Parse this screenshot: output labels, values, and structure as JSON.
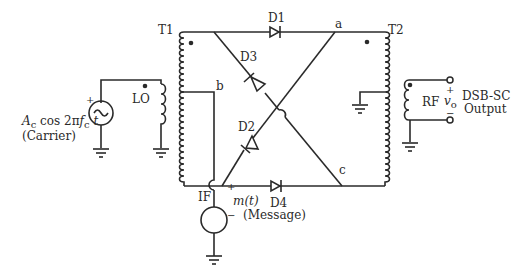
{
  "diagram": {
    "transformers": {
      "t1": {
        "label": "T1"
      },
      "t2": {
        "label": "T2"
      }
    },
    "diodes": [
      {
        "id": "d1",
        "label": "D1"
      },
      {
        "id": "d2",
        "label": "D2"
      },
      {
        "id": "d3",
        "label": "D3"
      },
      {
        "id": "d4",
        "label": "D4"
      }
    ],
    "nodes": {
      "a": "a",
      "b": "b",
      "c": "c"
    },
    "ports": {
      "lo": "LO",
      "if": "IF",
      "rf": "RF"
    },
    "carrier_source": {
      "expr_amp": "A",
      "expr_amp_sub": "c",
      "expr_rest": " cos 2π",
      "expr_f": "f",
      "expr_f_sub": "c",
      "expr_t": "t",
      "caption": "(Carrier)",
      "plus": "+"
    },
    "message_source": {
      "expr": "m(t)",
      "caption": "(Message)",
      "plus": "+",
      "minus": "−"
    },
    "output": {
      "plus": "+",
      "minus": "−",
      "v_label": "v",
      "v_sub": "o",
      "line1": "DSB-SC",
      "line2": "Output"
    }
  }
}
